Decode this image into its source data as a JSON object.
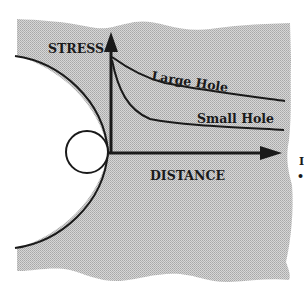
{
  "diagram": {
    "axes": {
      "y_label": "STRESS",
      "x_label": "DISTANCE"
    },
    "curves": [
      {
        "id": "large-hole",
        "label": "Large Hole"
      },
      {
        "id": "small-hole",
        "label": "Small Hole"
      }
    ],
    "shapes": {
      "large_hole": "large arc (edge of large hole)",
      "small_hole": "small circle"
    },
    "edge_fragments": [
      "I",
      "•"
    ],
    "colors": {
      "background": "#ffffff",
      "shaded_region": "#c8c8c8",
      "ink": "#1a1a1a"
    }
  }
}
